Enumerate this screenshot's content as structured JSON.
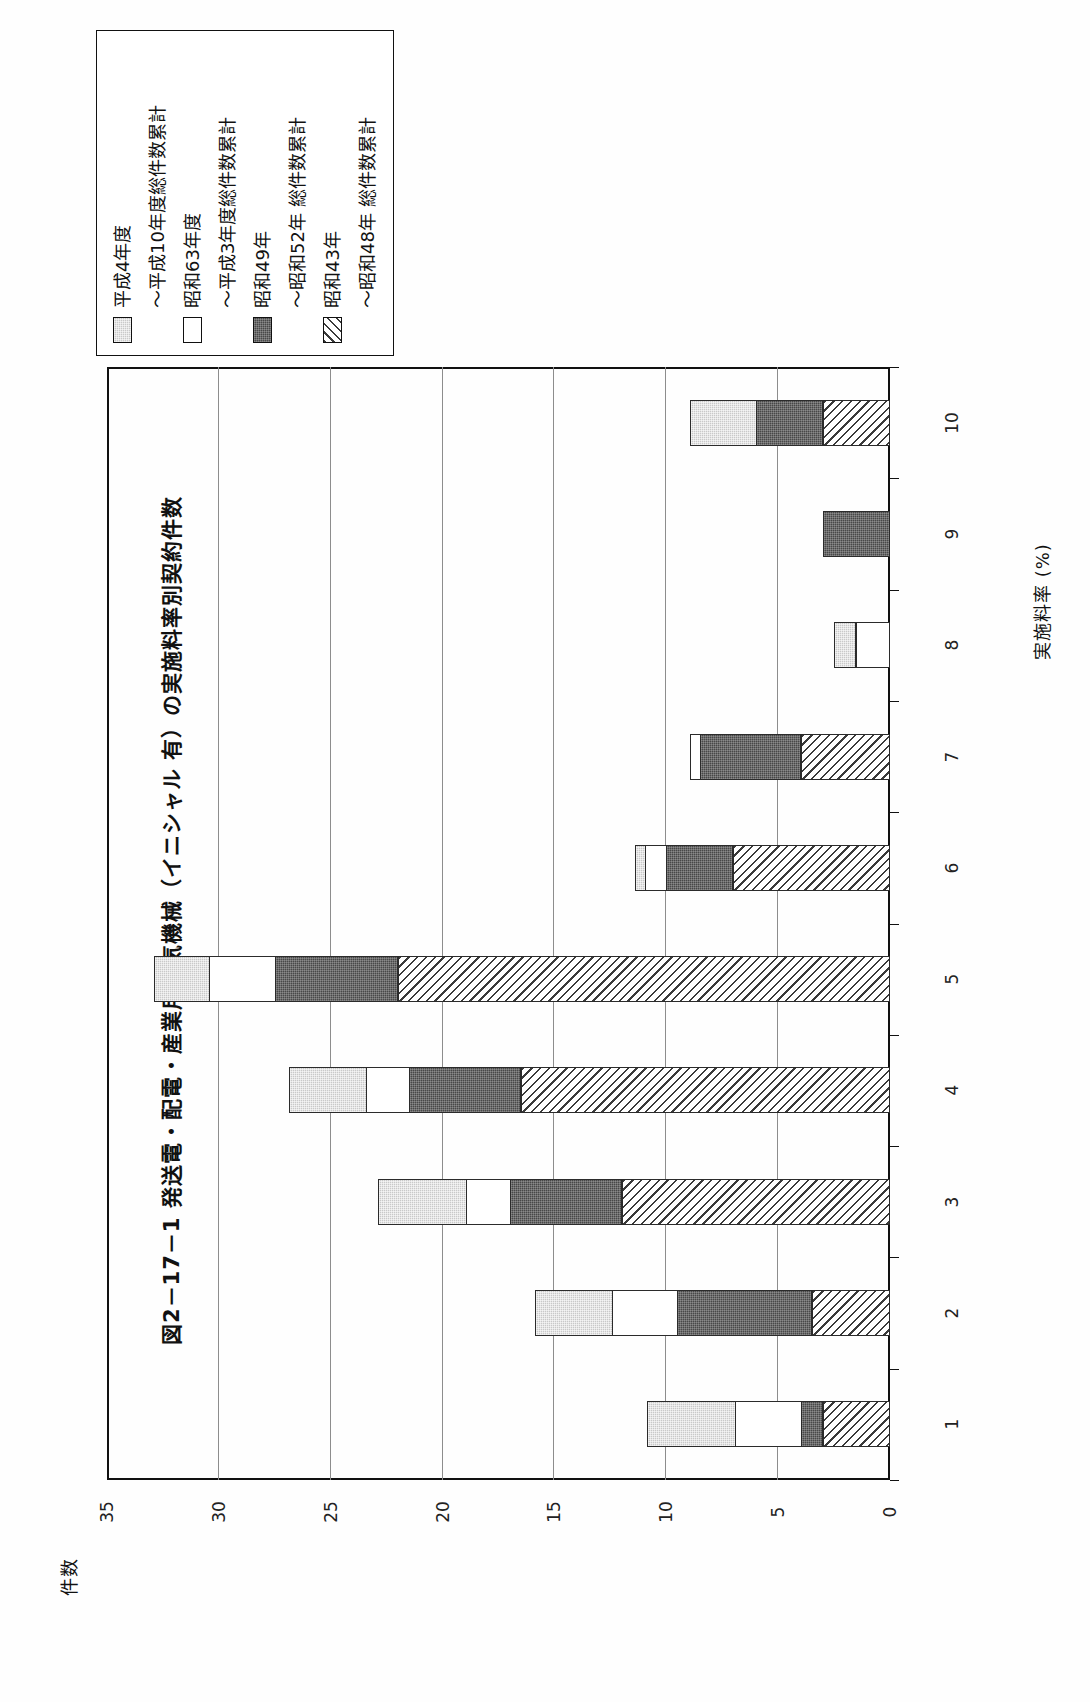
{
  "figure": {
    "title": "図2－17－1  発送電・配電・産業用電気機械（イニシャル 有）の実施料率別契約件数"
  },
  "legend": {
    "items": [
      {
        "label": "平成4年度",
        "swatch": "gray-dotted"
      },
      {
        "label": "〜平成10年度総件数累計",
        "swatch": "white"
      },
      {
        "label": "昭和63年度",
        "swatch": "white"
      },
      {
        "label": "〜平成3年度総件数累計",
        "swatch": "dark-dotted"
      },
      {
        "label": "昭和49年",
        "swatch": "dark-dotted"
      },
      {
        "label": "〜昭和52年 総件数累計",
        "swatch": "hatched"
      },
      {
        "label": "昭和43年",
        "swatch": "hatched"
      },
      {
        "label": "〜昭和48年 総件数累計",
        "swatch": "hatched"
      }
    ],
    "rows": [
      {
        "swatch": "gray-dotted",
        "line1": "平成4年度",
        "line2": "〜平成10年度総件数累計"
      },
      {
        "swatch": "white",
        "line1": "昭和63年度",
        "line2": "〜平成3年度総件数累計"
      },
      {
        "swatch": "dark-dotted",
        "line1": "昭和49年",
        "line2": "〜昭和52年 総件数累計"
      },
      {
        "swatch": "hatched",
        "line1": "昭和43年",
        "line2": "〜昭和48年 総件数累計"
      }
    ]
  },
  "axes": {
    "value_axis_label": "件数",
    "value_ticks": [
      "35",
      "30",
      "25",
      "20",
      "15",
      "10",
      "5",
      "0"
    ],
    "value_tick_values": [
      35,
      30,
      25,
      20,
      15,
      10,
      5,
      0
    ],
    "value_min": 0,
    "value_max": 35,
    "category_axis_label": "実施料率 (%)",
    "category_ticks": [
      "1",
      "2",
      "3",
      "4",
      "5",
      "6",
      "7",
      "8",
      "9",
      "10"
    ]
  },
  "colors": {
    "gray_dotted": "#c9c9c9",
    "white": "#ffffff",
    "dark_dotted": "#484848",
    "hatched": "#ffffff",
    "outline": "#2b2b2b",
    "grid": "#8d8d8d",
    "axis": "#111111"
  },
  "chart_data": {
    "type": "bar",
    "orientation": "horizontal",
    "stacked": true,
    "title": "図2－17－1  発送電・配電・産業用電気機械（イニシャル 有）の実施料率別契約件数",
    "xlabel": "実施料率 (%)",
    "ylabel": "件数",
    "ylim": [
      0,
      35
    ],
    "grid": true,
    "legend_position": "top-left",
    "categories": [
      "1",
      "2",
      "3",
      "4",
      "5",
      "6",
      "7",
      "8",
      "9",
      "10"
    ],
    "series": [
      {
        "name": "昭和43年〜昭和48年 総件数累計",
        "swatch": "hatched",
        "values": [
          3,
          3.5,
          12,
          16.5,
          22,
          7,
          4,
          0,
          0,
          3
        ]
      },
      {
        "name": "昭和49年〜昭和52年 総件数累計",
        "swatch": "dark-dotted",
        "values": [
          1,
          6,
          5,
          5,
          5.5,
          3,
          4.5,
          0,
          3,
          3
        ]
      },
      {
        "name": "昭和63年度〜平成3年度総件数累計",
        "swatch": "white",
        "values": [
          3,
          3,
          2,
          2,
          3,
          1,
          0.5,
          1.5,
          0,
          0
        ]
      },
      {
        "name": "平成4年度〜平成10年度総件数累計",
        "swatch": "gray-dotted",
        "values": [
          4,
          3.5,
          4,
          3.5,
          2.5,
          0.5,
          0,
          1,
          0,
          3
        ]
      }
    ],
    "totals": [
      11,
      16,
      23,
      27,
      33,
      11.5,
      9,
      2.5,
      3,
      9
    ]
  }
}
